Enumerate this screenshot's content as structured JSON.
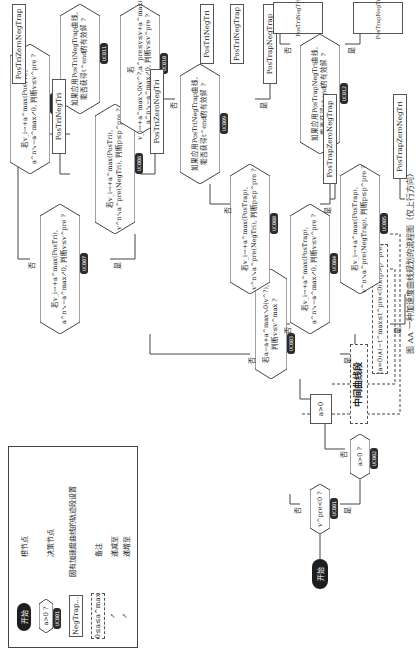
{
  "figure": {
    "caption": "图 AA 一种加速度曲线规划的流程图（仅上行方向）"
  },
  "legend": {
    "items": [
      {
        "symbol": "开始",
        "label": "根节点"
      },
      {
        "symbol": "a>0 ?",
        "badge": "UC001",
        "label": "决策节点"
      },
      {
        "symbol": "NegTrap...",
        "label": "固有加速度曲线的轨迹段设置"
      },
      {
        "symbol": "0≤a≤a^max",
        "label": "备注"
      },
      {
        "symbol": "↗",
        "label": "递减至"
      },
      {
        "symbol": "↗",
        "label": "递增至"
      }
    ]
  },
  "note": {
    "title": "中间曲线段",
    "condition": "(a=0)∧(−t^max≤t^pre<0)∧(p>p^pre)"
  },
  "nodes": {
    "start": "开始",
    "d1": {
      "text": "v^pre<0 ?",
      "badge": "UC001"
    },
    "d2": {
      "text": "a>0 ?",
      "badge": "UC002"
    },
    "box_a": "a>0",
    "d3": {
      "line1": "若a−a+a^max↘0(v^?),",
      "line2": "判断v≤v^max ?",
      "badge": "UC003"
    },
    "d4": {
      "line1": "若v_i→+a^max(PosTrap),",
      "line2": "a^n↘−a^max↗0, 判断v≤v^pre ?",
      "badge": "UC004"
    },
    "d5": {
      "line1": "若v_i→+a^max(PosTrap),",
      "line2": "v^n↘a^pre(NegTrap), 判断p≤p^pre ?",
      "badge": "UC005"
    },
    "d6": {
      "line1": "若v_i→+a^max(PosTri),",
      "line2": "v^n↘a^pre(NegTri), 判断p≤p^pre ?",
      "badge": "UC006"
    },
    "d7": {
      "line1": "若v_i→+a^max(PosTri),",
      "line2": "a^n↘−a^max↗0, 判断v≤v^pre ?",
      "badge": "UC007"
    },
    "d8": {
      "line1": "若v_i→+a^max(PosTrap),",
      "line2": "v^n↘a^pre(NegTri), 判断p≤p^pre ?",
      "badge": "UC008"
    },
    "d9": {
      "line1": "如果应用PosTriNegTrap曲线,",
      "line2": "能否获得t^end的有效解 ?",
      "badge": "UC009"
    },
    "d10": {
      "line1": "若v_i→+a^max↘0(v^?,a^pre≤v≤v+a^max),",
      "line2": "a^n↘−a^max↗0, 判断v≤v^pre ?",
      "badge": "UC010"
    },
    "d11": {
      "line1": "如果应用PosTriNegTrap曲线,",
      "line2": "能否获得t^end的有效解 ?",
      "badge": "UC011"
    },
    "d12": {
      "line1": "如果应用PosTrapNegTri曲线,",
      "line2": "能否获得t^end的有效解 ?",
      "badge": "UC012"
    },
    "d13": {
      "line1": "若v_i→+a^max(PosTri),",
      "line2": "a^n↘−a^max↗0, 判断v≤v^pre ?",
      "badge": "UC013"
    }
  },
  "boxes": {
    "PosTriNegTri_top": "PosTriNegTri",
    "PosTriZeroNegTri": "PosTriZeroNegTri",
    "PosTriZeroNegTrap": "PosTriZeroNegTrap",
    "PosTrapZeroNegTrap": "PosTrapZeroNegTrap",
    "PosTrapNegTrap": "PosTrapNegTrap",
    "PosTriNegTrap": "PosTriNegTrap",
    "PosTriNegTri_right": "PosTriNegTri",
    "PosTrapZeroNegTri": "PosTrapZeroNegTri",
    "PosTrapNegTri": "PosTrapNegTri",
    "PosTriNegTri_bottom": "PosTriNegTri"
  },
  "edge_labels": {
    "yes": "是",
    "no": "否"
  }
}
